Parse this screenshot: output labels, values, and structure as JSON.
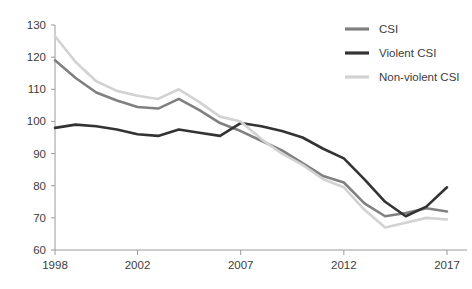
{
  "chart_data": {
    "type": "line",
    "title": "",
    "subtitle": "",
    "xlabel": "",
    "ylabel": "",
    "xlim": [
      1998,
      2017
    ],
    "ylim": [
      60,
      130
    ],
    "grid": false,
    "legend_position": "top-right",
    "x": [
      1998,
      1999,
      2000,
      2001,
      2002,
      2003,
      2004,
      2005,
      2006,
      2007,
      2008,
      2009,
      2010,
      2011,
      2012,
      2013,
      2014,
      2015,
      2016,
      2017
    ],
    "xticks": [
      1998,
      2002,
      2007,
      2012,
      2017
    ],
    "xtick_labels": [
      "1998",
      "2002",
      "2007",
      "2012",
      "2017"
    ],
    "yticks": [
      60,
      70,
      80,
      90,
      100,
      110,
      120,
      130
    ],
    "ytick_labels": [
      "60",
      "70",
      "80",
      "90",
      "100",
      "110",
      "120",
      "130"
    ],
    "series": [
      {
        "name": "CSI",
        "color": "#808080",
        "width": 2.6,
        "values": [
          119.0,
          113.5,
          109.0,
          106.5,
          104.5,
          104.0,
          107.0,
          103.5,
          99.5,
          97.0,
          94.0,
          91.0,
          87.0,
          83.0,
          81.0,
          74.5,
          70.5,
          71.5,
          73.0,
          72.0
        ]
      },
      {
        "name": "Violent CSI",
        "color": "#333333",
        "width": 2.6,
        "values": [
          98.0,
          99.0,
          98.5,
          97.5,
          96.0,
          95.5,
          97.5,
          96.5,
          95.5,
          99.5,
          98.5,
          97.0,
          95.0,
          91.5,
          88.5,
          82.0,
          75.0,
          70.5,
          73.5,
          79.5
        ]
      },
      {
        "name": "Non-violent CSI",
        "color": "#d2d2d2",
        "width": 2.6,
        "values": [
          126.5,
          118.5,
          112.5,
          109.5,
          108.0,
          107.0,
          110.0,
          106.0,
          101.5,
          100.0,
          94.5,
          90.0,
          86.5,
          82.0,
          79.5,
          72.5,
          67.0,
          68.5,
          70.0,
          69.5
        ]
      }
    ]
  },
  "legend": {
    "items": [
      {
        "label": "CSI"
      },
      {
        "label": "Violent CSI"
      },
      {
        "label": "Non-violent CSI"
      }
    ]
  }
}
